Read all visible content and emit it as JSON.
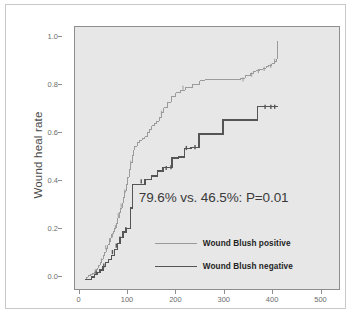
{
  "chart_data": {
    "type": "line",
    "title": "",
    "subtitle": "",
    "xlabel": "",
    "ylabel": "Wound heal rate",
    "xlim": [
      -20,
      530
    ],
    "ylim": [
      -0.04,
      1.06
    ],
    "xticks": [
      0,
      100,
      200,
      300,
      400,
      500
    ],
    "xtick_labels": [
      "0",
      "100",
      "200",
      "300",
      "400",
      "500"
    ],
    "yticks": [
      0.0,
      0.2,
      0.4,
      0.6,
      0.8,
      1.0
    ],
    "ytick_labels": [
      "0.0",
      "0.2",
      "0.4",
      "0.6",
      "0.8",
      "1.0"
    ],
    "grid": false,
    "legend_position": "inside-lower-right",
    "panel_background": "#e7e7e7",
    "annotation": "79.6% vs. 46.5%: P=0.01",
    "series": [
      {
        "name": "Wound Blush positive",
        "color": "#9a9a9a",
        "linewidth": 1,
        "step": "post",
        "final_value": 1.0,
        "event_percent": 79.6,
        "x": [
          0,
          5,
          8,
          12,
          16,
          20,
          24,
          27,
          30,
          33,
          36,
          39,
          42,
          45,
          48,
          51,
          54,
          57,
          60,
          63,
          66,
          69,
          72,
          75,
          78,
          81,
          84,
          87,
          90,
          93,
          96,
          99,
          102,
          105,
          110,
          115,
          120,
          125,
          130,
          135,
          140,
          145,
          150,
          155,
          160,
          165,
          172,
          180,
          190,
          200,
          210,
          225,
          240,
          250,
          270,
          290,
          310,
          325,
          335,
          345,
          352,
          358,
          365,
          372,
          378,
          384,
          390,
          395,
          399,
          401,
          403
        ],
        "y": [
          0.0,
          0.01,
          0.015,
          0.02,
          0.025,
          0.03,
          0.04,
          0.05,
          0.06,
          0.07,
          0.085,
          0.1,
          0.115,
          0.13,
          0.145,
          0.16,
          0.175,
          0.19,
          0.2,
          0.215,
          0.235,
          0.26,
          0.28,
          0.3,
          0.32,
          0.345,
          0.37,
          0.4,
          0.43,
          0.46,
          0.49,
          0.52,
          0.545,
          0.56,
          0.575,
          0.585,
          0.59,
          0.6,
          0.615,
          0.63,
          0.645,
          0.655,
          0.665,
          0.68,
          0.7,
          0.72,
          0.745,
          0.77,
          0.785,
          0.795,
          0.805,
          0.82,
          0.835,
          0.838,
          0.84,
          0.84,
          0.84,
          0.845,
          0.855,
          0.865,
          0.875,
          0.878,
          0.882,
          0.886,
          0.895,
          0.9,
          0.905,
          0.915,
          0.925,
          1.0,
          1.0
        ],
        "censor_x": [
          22,
          35,
          44,
          52,
          58,
          64,
          70,
          76,
          84,
          96,
          160,
          205,
          330,
          348,
          362,
          374,
          388,
          396
        ],
        "censor_y": [
          0.035,
          0.08,
          0.135,
          0.165,
          0.185,
          0.22,
          0.27,
          0.31,
          0.37,
          0.49,
          0.7,
          0.805,
          0.84,
          0.86,
          0.875,
          0.884,
          0.897,
          0.918
        ]
      },
      {
        "name": "Wound Blush negative",
        "color": "#555555",
        "linewidth": 1.4,
        "step": "post",
        "final_value": 0.725,
        "event_percent": 46.5,
        "x": [
          0,
          8,
          14,
          20,
          26,
          32,
          38,
          44,
          50,
          56,
          62,
          68,
          74,
          80,
          86,
          90,
          95,
          100,
          112,
          126,
          140,
          152,
          163,
          172,
          182,
          196,
          208,
          222,
          238,
          246,
          262,
          288,
          300,
          330,
          360,
          372,
          378,
          386,
          398,
          402
        ],
        "y": [
          0.0,
          0.0,
          0.01,
          0.02,
          0.03,
          0.04,
          0.055,
          0.07,
          0.085,
          0.1,
          0.125,
          0.15,
          0.175,
          0.2,
          0.215,
          0.215,
          0.3,
          0.4,
          0.4,
          0.42,
          0.435,
          0.455,
          0.47,
          0.47,
          0.51,
          0.515,
          0.55,
          0.555,
          0.61,
          0.61,
          0.61,
          0.67,
          0.67,
          0.67,
          0.725,
          0.725,
          0.725,
          0.725,
          0.725,
          0.725
        ],
        "censor_x": [
          24,
          40,
          58,
          66,
          74,
          86,
          118,
          170,
          180,
          212,
          230,
          376,
          388,
          396
        ],
        "censor_y": [
          0.028,
          0.058,
          0.115,
          0.142,
          0.172,
          0.212,
          0.412,
          0.468,
          0.472,
          0.552,
          0.556,
          0.725,
          0.725,
          0.725
        ]
      }
    ]
  },
  "legend": {
    "items": [
      {
        "label": "Wound Blush positive",
        "color": "#9a9a9a"
      },
      {
        "label": "Wound Blush negative",
        "color": "#555555"
      }
    ]
  },
  "axis": {
    "y_title": "Wound heal rate"
  }
}
